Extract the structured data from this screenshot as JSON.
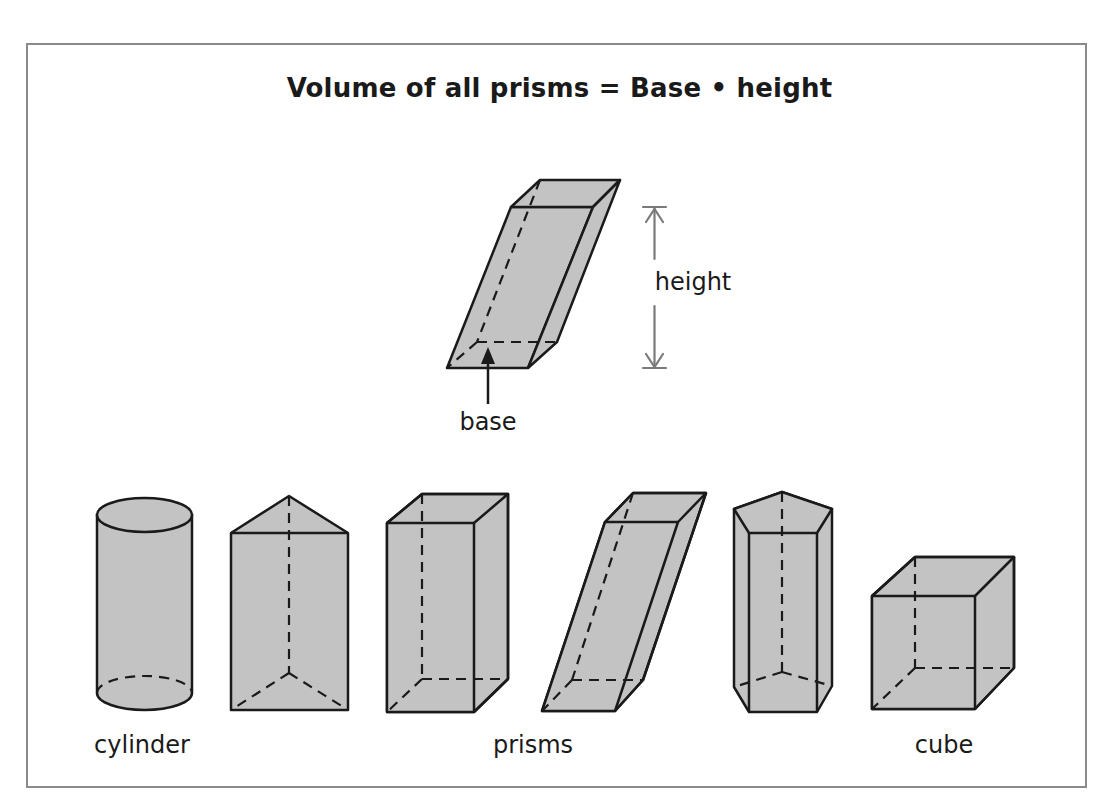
{
  "title": "Volume of all prisms = Base • height",
  "colors": {
    "frame_border": "#8a8a8a",
    "shape_fill": "#c3c3c3",
    "shape_stroke": "#1a1a1a",
    "height_arrow": "#7a7a7a",
    "text": "#1a1a1a",
    "background": "#ffffff"
  },
  "main_figure": {
    "shape": "oblique rectangular prism",
    "height_label": "height",
    "base_label": "base"
  },
  "examples": [
    {
      "shape": "cylinder",
      "group_label": "cylinder"
    },
    {
      "shape": "triangular prism",
      "group_label": "prisms"
    },
    {
      "shape": "rectangular prism",
      "group_label": "prisms"
    },
    {
      "shape": "oblique rectangular prism",
      "group_label": "prisms"
    },
    {
      "shape": "pentagonal prism",
      "group_label": "prisms"
    },
    {
      "shape": "cube",
      "group_label": "cube"
    }
  ],
  "labels": {
    "cylinder": "cylinder",
    "prisms": "prisms",
    "cube": "cube"
  }
}
